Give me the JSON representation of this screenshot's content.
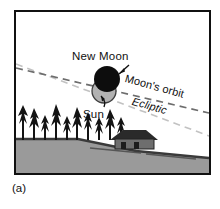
{
  "figure": {
    "caption": "(a)",
    "panel_border_color": "#111111",
    "sky_color": "#ffffff",
    "ground_color": "#9a9a9a",
    "horizon_color": "#3a3a3a"
  },
  "labels": {
    "new_moon": "New Moon",
    "sun": "Sun",
    "moons_orbit": "Moon's orbit",
    "ecliptic": "Ecliptic"
  },
  "bodies": {
    "new_moon": {
      "name": "New Moon",
      "color": "#0d0d0d",
      "cx": 91,
      "cy": 67,
      "r": 13
    },
    "sun": {
      "name": "Sun",
      "color": "#b0b0b0",
      "outline": "#3a3a3a",
      "cx": 88,
      "cy": 79,
      "r": 12
    }
  },
  "lines": {
    "moons_orbit": {
      "label": "Moon's orbit",
      "color": "#6d6d6d",
      "style": "dashed",
      "x1": 2,
      "y1": 56,
      "x2": 193,
      "y2": 101
    },
    "ecliptic": {
      "label": "Ecliptic",
      "color": "#bdbdbd",
      "style": "dashed",
      "x1": 2,
      "y1": 52,
      "x2": 193,
      "y2": 124
    }
  },
  "annotations": {
    "new_moon_arrow": "arrow pointing down-left to the New Moon disc",
    "sun_arrow": "curved arrow pointing up to the Sun disc"
  },
  "landscape": {
    "trees_label": "conifer tree silhouettes",
    "house_label": "cabin silhouette",
    "horizon_label": "sloping horizon line"
  }
}
